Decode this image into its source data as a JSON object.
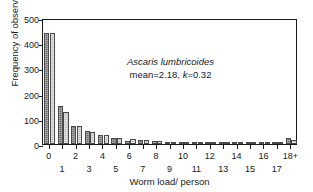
{
  "chart_data": {
    "type": "bar",
    "title": "",
    "subtitle": "",
    "xlabel": "Worm load/ person",
    "ylabel": "Frequency of observation",
    "categories": [
      "0",
      "1",
      "2",
      "3",
      "4",
      "5",
      "6",
      "7",
      "8",
      "9",
      "10",
      "11",
      "12",
      "13",
      "14",
      "15",
      "16",
      "17",
      "18+"
    ],
    "ylim": [
      0,
      500
    ],
    "yticks": [
      0,
      100,
      200,
      300,
      400,
      500
    ],
    "grid": false,
    "legend": "none",
    "series": [
      {
        "name": "observed",
        "shade": "dark",
        "values": [
          440,
          150,
          72,
          50,
          34,
          25,
          13,
          14,
          11,
          4,
          5,
          4,
          3,
          2,
          2,
          2,
          1,
          1,
          22
        ]
      },
      {
        "name": "fitted",
        "shade": "light",
        "values": [
          440,
          128,
          72,
          49,
          36,
          25,
          19,
          14,
          11,
          8,
          7,
          5,
          4,
          3,
          3,
          2,
          2,
          2,
          14
        ]
      }
    ],
    "annotations": [
      {
        "text": "Ascaris lumbricoides",
        "style": "italic"
      },
      {
        "text": "mean=2.18, k=0.32",
        "style": "plain",
        "italic_part": "k"
      }
    ]
  },
  "annotation": {
    "species": "Ascaris lumbricoides",
    "stats_prefix": "mean=2.18, ",
    "stats_k": "k",
    "stats_suffix": "=0.32"
  },
  "axes": {
    "y_title": "Frequency of observation",
    "x_title": "Worm load/ person"
  },
  "colors": {
    "dark_bar": "#6e6e6e",
    "light_bar": "#bdbdbd",
    "axis": "#1a1a1a",
    "background": "#ffffff"
  }
}
